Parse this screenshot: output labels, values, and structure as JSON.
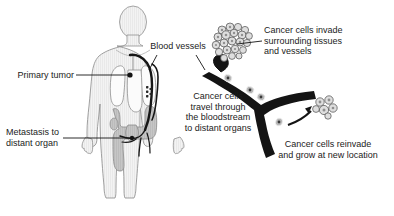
{
  "figure": {
    "background_color": "#ffffff",
    "text_color": "#1b1b1b",
    "body_fill": "#f2f2f2",
    "body_outline": "#8c8c8c",
    "organ_fill": "#c9c9c9",
    "organ_outline": "#8a8a8a",
    "vessel_color": "#1a1a1a",
    "cell_fill": "#dcdcdc",
    "cell_outline": "#4a4a4a"
  },
  "labels": {
    "primary_tumor": "Primary tumor",
    "metastasis": "Metastasis to\ndistant organ",
    "blood_vessels": "Blood vessels",
    "invade": "Cancer cells invade\nsurrounding tissues\nand vessels",
    "travel": "Cancer cells\ntravel through\nthe bloodstream\nto distant organs",
    "reinvade": "Cancer cells reinvade\nand grow at new location"
  },
  "anatomy": {
    "body_figure": "human-body-torso-figure",
    "lungs": "lungs",
    "intestines": "intestines-colon",
    "tumor_marker": "primary-tumor-marker",
    "vessel_network": "blood-vessel-network"
  },
  "magnified": {
    "vessel": "branching-blood-vessel",
    "cluster_primary": "cancer-cell-cluster-invading",
    "cluster_distant": "cancer-cell-cluster-new-location",
    "arrow": "arrow-to-new-location"
  }
}
